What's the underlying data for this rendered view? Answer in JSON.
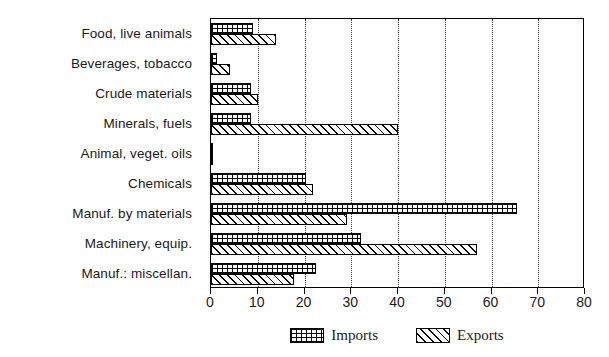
{
  "chart_data": {
    "type": "bar",
    "orientation": "horizontal",
    "title": "",
    "xlabel": "",
    "ylabel": "",
    "xlim": [
      0,
      80
    ],
    "xticks": [
      0,
      10,
      20,
      30,
      40,
      50,
      60,
      70,
      80
    ],
    "grid": "vertical-dotted",
    "legend_position": "bottom-center",
    "categories": [
      "Food, live animals",
      "Beverages, tobacco",
      "Crude materials",
      "Minerals, fuels",
      "Animal, veget. oils",
      "Chemicals",
      "Manuf. by materials",
      "Machinery, equip.",
      "Manuf.: miscellan."
    ],
    "series": [
      {
        "name": "Imports",
        "pattern": "grid-crosshatch",
        "values": [
          9.0,
          1.3,
          8.5,
          8.5,
          0.4,
          20.3,
          65.5,
          32.0,
          22.5
        ]
      },
      {
        "name": "Exports",
        "pattern": "diagonal-hatch",
        "values": [
          14.0,
          4.0,
          10.0,
          40.0,
          0.4,
          21.8,
          29.0,
          57.0,
          17.8
        ]
      }
    ]
  },
  "legend": {
    "items": [
      {
        "label": "Imports"
      },
      {
        "label": "Exports"
      }
    ]
  },
  "colors": {
    "foreground": "#000000",
    "background": "#ffffff",
    "grid": "#444444"
  }
}
